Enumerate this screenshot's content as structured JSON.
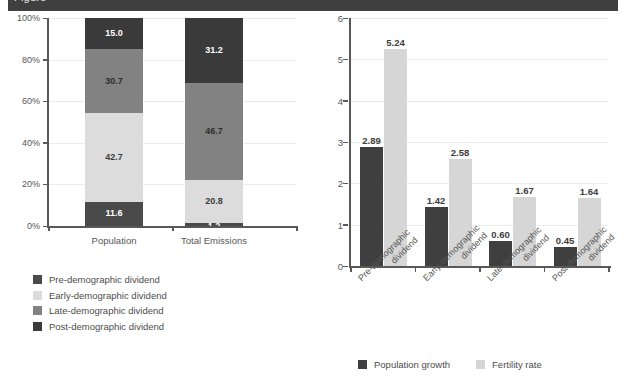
{
  "banner": {
    "cut_text": "Figure"
  },
  "chart_data": [
    {
      "id": "left",
      "type": "bar",
      "subtype": "stacked-100",
      "title": "",
      "xlabel": "",
      "ylabel": "",
      "ylim": [
        0,
        100
      ],
      "ytick_labels": [
        "0%",
        "20%",
        "40%",
        "60%",
        "80%",
        "100%"
      ],
      "ytick_values": [
        0,
        20,
        40,
        60,
        80,
        100
      ],
      "grid": true,
      "legend_position": "below-left",
      "categories": [
        "Population",
        "Total Emissions"
      ],
      "series": [
        {
          "name": "Pre-demographic dividend",
          "color": "#4a4a4a",
          "label_color": "#ffffff",
          "values": [
            11.6,
            1.2
          ],
          "labels": [
            "11.6",
            "1.2"
          ]
        },
        {
          "name": "Early-demographic dividend",
          "color": "#dcdcdc",
          "label_color": "#3d3d3d",
          "values": [
            42.7,
            20.8
          ],
          "labels": [
            "42.7",
            "20.8"
          ]
        },
        {
          "name": "Late-demographic dividend",
          "color": "#828282",
          "label_color": "#2e2e2e",
          "values": [
            30.7,
            46.7
          ],
          "labels": [
            "30.7",
            "46.7"
          ]
        },
        {
          "name": "Post-demographic dividend",
          "color": "#3a3a3a",
          "label_color": "#ffffff",
          "values": [
            15.0,
            31.2
          ],
          "labels": [
            "15.0",
            "31.2"
          ]
        }
      ]
    },
    {
      "id": "right",
      "type": "bar",
      "subtype": "grouped",
      "title": "",
      "xlabel": "",
      "ylabel": "",
      "ylim": [
        0,
        6
      ],
      "ytick_labels": [
        "0",
        "1",
        "2",
        "3",
        "4",
        "5",
        "6"
      ],
      "ytick_values": [
        0,
        1,
        2,
        3,
        4,
        5,
        6
      ],
      "grid": true,
      "legend_position": "bottom",
      "categories": [
        "Pre-demographic\ndividend",
        "Early-demographic\ndividend",
        "Late-demographic\ndividend",
        "Post-demographic\ndividend"
      ],
      "category_lines": [
        [
          "Pre-demographic",
          "dividend"
        ],
        [
          "Early-demographic",
          "dividend"
        ],
        [
          "Late-demographic",
          "dividend"
        ],
        [
          "Post-demographic",
          "dividend"
        ]
      ],
      "series": [
        {
          "name": "Population growth",
          "color": "#3f3f3f",
          "values": [
            2.89,
            1.42,
            0.6,
            0.45
          ],
          "labels": [
            "2.89",
            "1.42",
            "0.60",
            "0.45"
          ]
        },
        {
          "name": "Fertility rate",
          "color": "#d6d6d6",
          "values": [
            5.24,
            2.58,
            1.67,
            1.64
          ],
          "labels": [
            "5.24",
            "2.58",
            "1.67",
            "1.64"
          ]
        }
      ]
    }
  ]
}
